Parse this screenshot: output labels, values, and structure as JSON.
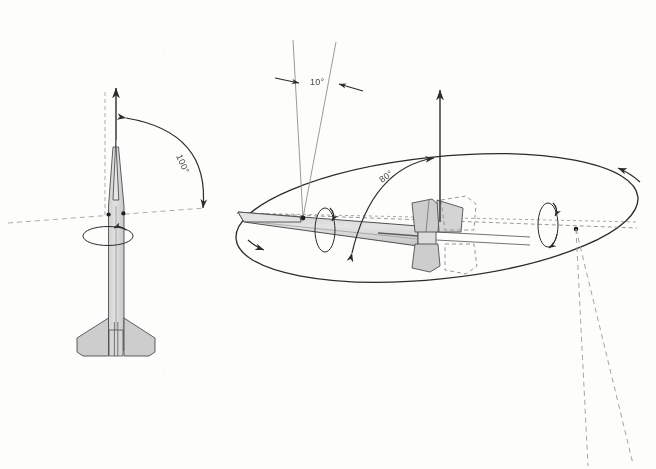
{
  "figure": {
    "background_color": "#fdfdfb",
    "ink_color": "#2b2b2b",
    "body_fill_color": "#d9d9d9",
    "fin_fill_color": "#cdcdcd",
    "guide_color": "#9a9a9a"
  },
  "labels": {
    "pitch_angle": "100°",
    "cone_half_angle": "10°",
    "tilt_angle": "80°"
  },
  "left_view": {
    "name": "vertical-rocket-view",
    "pitch_angle_label": "100°",
    "elements": [
      "vertical reference axis (dashed)",
      "upward velocity arrow",
      "100 degree pitch arc with double arrowheads",
      "horizontal dashed reference line through pivot",
      "roll rotation ellipse with arrowhead",
      "rocket body with nose cone and four swept fins"
    ]
  },
  "right_view": {
    "name": "cone-of-rotation-view",
    "cone_half_angle_label": "10°",
    "tilt_angle_label": "80°",
    "elements": [
      "large ellipse representing cone of rotation",
      "narrow 10 degree cone from nose point",
      "vertical upward arrow",
      "80 degree arc from rocket axis to vertical arrow",
      "roll ellipse near nose with arrowhead",
      "roll ellipse near tail with arrowhead",
      "tilted rocket body with fins and ghosted fin outline",
      "dashed center axis of ellipse",
      "two dashed rays descending to lower right"
    ]
  }
}
